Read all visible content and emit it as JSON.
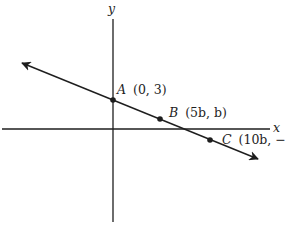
{
  "diagram": {
    "type": "coordinate-plane",
    "axes": {
      "x_label": "x",
      "y_label": "y"
    },
    "line": {
      "description": "line with negative slope passing through A, B, C",
      "arrows": "both ends"
    },
    "points": [
      {
        "name": "A",
        "coords": "(0, 3)"
      },
      {
        "name": "B",
        "coords": "(5b, b)"
      },
      {
        "name": "C",
        "coords": "(10b, −b)"
      }
    ],
    "colors": {
      "stroke": "#1e1e1e",
      "background": "#ffffff"
    }
  }
}
